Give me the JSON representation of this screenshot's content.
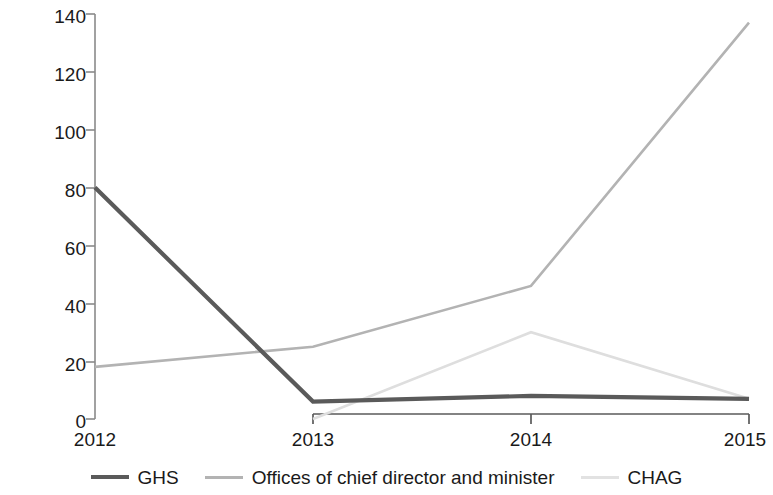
{
  "chart_data": {
    "type": "line",
    "title": "",
    "xlabel": "",
    "ylabel": "Millions",
    "categories": [
      "2012",
      "2013",
      "2014",
      "2015"
    ],
    "x": [
      2012,
      2013,
      2014,
      2015
    ],
    "ylim": [
      0,
      140
    ],
    "yticks": [
      0,
      20,
      40,
      60,
      80,
      100,
      120,
      140
    ],
    "ytick_labels": [
      "0",
      "20",
      "40",
      "60",
      "80",
      "100",
      "120",
      "140"
    ],
    "grid": false,
    "legend_position": "bottom",
    "series": [
      {
        "name": "GHS",
        "color": "#5a5a5a",
        "line_width": 4.2,
        "values": [
          80,
          6,
          8,
          7
        ]
      },
      {
        "name": "Offices of chief director and minister",
        "color": "#b3b3b3",
        "line_width": 2.6,
        "values": [
          18,
          25,
          46,
          137
        ]
      },
      {
        "name": "CHAG",
        "color": "#dedede",
        "line_width": 2.6,
        "values": [
          null,
          0,
          30,
          7
        ]
      }
    ]
  },
  "legend": {
    "items": [
      {
        "label": "GHS",
        "color": "#5a5a5a",
        "thickness": "4px"
      },
      {
        "label": "Offices of chief director and minister",
        "color": "#b3b3b3",
        "thickness": "3px"
      },
      {
        "label": "CHAG",
        "color": "#e2e2e2",
        "thickness": "3px"
      }
    ]
  },
  "axes": {
    "y_title": "Millions",
    "y_labels": [
      "140",
      "120",
      "100",
      "80",
      "60",
      "40",
      "20",
      "0"
    ],
    "x_labels": [
      "2012",
      "2013",
      "2014",
      "2015"
    ]
  }
}
